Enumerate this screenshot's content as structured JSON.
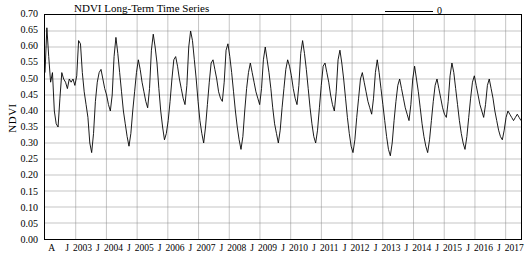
{
  "chart_data": {
    "type": "line",
    "title": "NDVI Long-Term Time Series",
    "xlabel": "",
    "ylabel": "NDVI",
    "ylim": [
      0.0,
      0.7
    ],
    "ytick_labels": [
      "0.70",
      "0.65",
      "0.60",
      "0.55",
      "0.50",
      "0.45",
      "0.40",
      "0.35",
      "0.30",
      "0.25",
      "0.20",
      "0.15",
      "0.10",
      "0.05",
      "0.00"
    ],
    "ytick_values": [
      0.7,
      0.65,
      0.6,
      0.55,
      0.5,
      0.45,
      0.4,
      0.35,
      0.3,
      0.25,
      0.2,
      0.15,
      0.1,
      0.05,
      0.0
    ],
    "xtick_labels": [
      "A",
      "J",
      "2003",
      "J",
      "2004",
      "J",
      "2005",
      "J",
      "2006",
      "J",
      "2007",
      "J",
      "2008",
      "J",
      "2009",
      "J",
      "2010",
      "J",
      "2011",
      "J",
      "2012",
      "J",
      "2013",
      "J",
      "2014",
      "J",
      "2015",
      "J",
      "2016",
      "J",
      "2017"
    ],
    "grid": "vertical and horizontal gridlines",
    "legend": {
      "position": "top-right",
      "entries": [
        {
          "name": "0",
          "color": "#000000"
        }
      ]
    },
    "series": [
      {
        "name": "0",
        "color": "#000000",
        "values": [
          0.52,
          0.66,
          0.57,
          0.49,
          0.52,
          0.4,
          0.36,
          0.35,
          0.44,
          0.52,
          0.5,
          0.49,
          0.47,
          0.5,
          0.49,
          0.5,
          0.48,
          0.51,
          0.62,
          0.61,
          0.52,
          0.46,
          0.42,
          0.38,
          0.3,
          0.27,
          0.33,
          0.43,
          0.49,
          0.52,
          0.53,
          0.5,
          0.47,
          0.45,
          0.42,
          0.4,
          0.45,
          0.57,
          0.63,
          0.58,
          0.52,
          0.46,
          0.4,
          0.36,
          0.32,
          0.29,
          0.33,
          0.4,
          0.46,
          0.52,
          0.56,
          0.53,
          0.49,
          0.46,
          0.43,
          0.41,
          0.47,
          0.59,
          0.64,
          0.6,
          0.55,
          0.47,
          0.4,
          0.35,
          0.31,
          0.33,
          0.37,
          0.43,
          0.5,
          0.56,
          0.57,
          0.54,
          0.5,
          0.47,
          0.44,
          0.42,
          0.48,
          0.6,
          0.65,
          0.62,
          0.56,
          0.5,
          0.43,
          0.37,
          0.33,
          0.3,
          0.35,
          0.42,
          0.49,
          0.55,
          0.56,
          0.53,
          0.5,
          0.46,
          0.44,
          0.43,
          0.49,
          0.59,
          0.61,
          0.57,
          0.52,
          0.46,
          0.4,
          0.35,
          0.31,
          0.28,
          0.32,
          0.4,
          0.47,
          0.52,
          0.55,
          0.52,
          0.49,
          0.46,
          0.44,
          0.42,
          0.47,
          0.56,
          0.6,
          0.56,
          0.52,
          0.47,
          0.41,
          0.36,
          0.33,
          0.3,
          0.34,
          0.41,
          0.47,
          0.53,
          0.56,
          0.54,
          0.51,
          0.47,
          0.44,
          0.42,
          0.48,
          0.58,
          0.62,
          0.58,
          0.53,
          0.47,
          0.41,
          0.36,
          0.32,
          0.3,
          0.34,
          0.41,
          0.48,
          0.54,
          0.55,
          0.52,
          0.49,
          0.45,
          0.42,
          0.4,
          0.46,
          0.56,
          0.59,
          0.55,
          0.5,
          0.44,
          0.38,
          0.33,
          0.29,
          0.27,
          0.31,
          0.38,
          0.44,
          0.5,
          0.52,
          0.49,
          0.46,
          0.43,
          0.41,
          0.39,
          0.44,
          0.52,
          0.56,
          0.52,
          0.47,
          0.42,
          0.37,
          0.32,
          0.28,
          0.26,
          0.3,
          0.37,
          0.43,
          0.48,
          0.5,
          0.47,
          0.44,
          0.41,
          0.39,
          0.37,
          0.42,
          0.5,
          0.54,
          0.5,
          0.46,
          0.41,
          0.36,
          0.32,
          0.29,
          0.27,
          0.31,
          0.37,
          0.43,
          0.48,
          0.5,
          0.47,
          0.44,
          0.41,
          0.39,
          0.38,
          0.43,
          0.51,
          0.55,
          0.52,
          0.47,
          0.42,
          0.37,
          0.33,
          0.3,
          0.28,
          0.32,
          0.38,
          0.44,
          0.49,
          0.51,
          0.48,
          0.45,
          0.42,
          0.4,
          0.38,
          0.42,
          0.48,
          0.5,
          0.47,
          0.44,
          0.4,
          0.37,
          0.34,
          0.32,
          0.31,
          0.34,
          0.38,
          0.4,
          0.39,
          0.38,
          0.37,
          0.38,
          0.39,
          0.38,
          0.37
        ]
      }
    ]
  }
}
